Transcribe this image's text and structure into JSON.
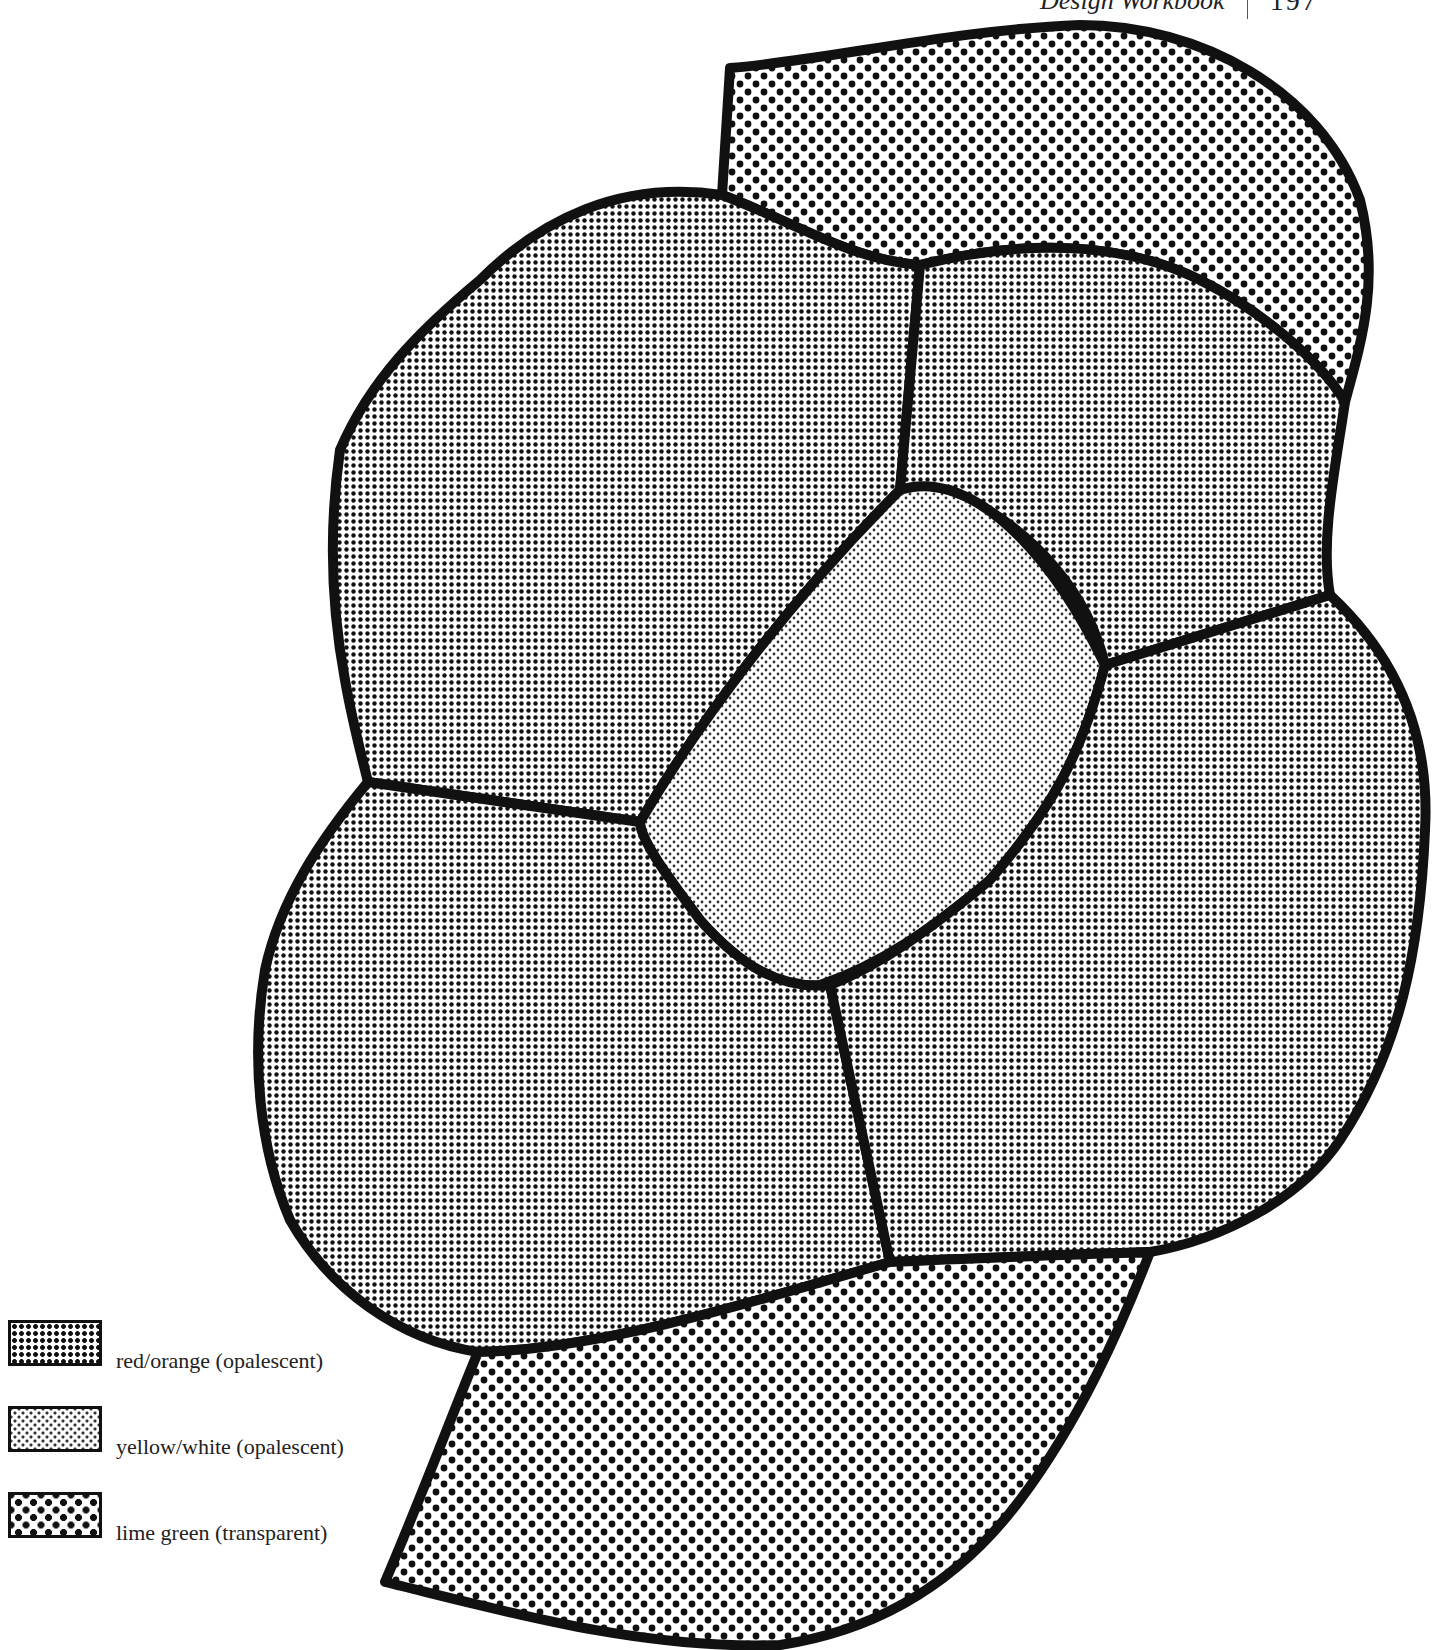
{
  "running_head": {
    "title": "Design Workbook",
    "page_number": "197"
  },
  "diagram": {
    "outline_color": "#111111",
    "pieces": [
      {
        "id": "top-leaf",
        "material": "lime green (transparent)"
      },
      {
        "id": "upper-left-petal",
        "material": "red/orange (opalescent)"
      },
      {
        "id": "upper-right-petal",
        "material": "red/orange (opalescent)"
      },
      {
        "id": "lower-left-petal",
        "material": "red/orange (opalescent)"
      },
      {
        "id": "lower-right-petal",
        "material": "red/orange (opalescent)"
      },
      {
        "id": "center",
        "material": "yellow/white (opalescent)"
      },
      {
        "id": "bottom-leaf",
        "material": "lime green (transparent)"
      }
    ]
  },
  "legend": {
    "items": [
      {
        "label": "red/orange (opalescent)",
        "pattern": "fine-square-dots"
      },
      {
        "label": "yellow/white (opalescent)",
        "pattern": "light-fine-dots"
      },
      {
        "label": "lime green (transparent)",
        "pattern": "large-staggered-dots"
      }
    ]
  }
}
